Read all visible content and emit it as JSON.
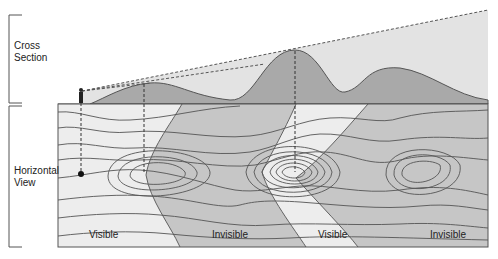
{
  "figure": {
    "sections": {
      "cross_section": {
        "label_line1": "Cross",
        "label_line2": "Section"
      },
      "horizontal_view": {
        "label_line1": "Horizontal",
        "label_line2": "View"
      }
    },
    "regions": [
      {
        "label": "Visible",
        "x": 89
      },
      {
        "label": "Invisible",
        "x": 212
      },
      {
        "label": "Visible",
        "x": 318
      },
      {
        "label": "Invisible",
        "x": 430
      }
    ],
    "colors": {
      "terrain_fill": "#a9a9a9",
      "sightline_wedge": "#e3e3e3",
      "visible_zone": "#ededed",
      "invisible_zone": "#c6c6c6",
      "contour_stroke": "#555555",
      "frame_stroke": "#555555"
    },
    "caption": "Figure 4.2  ..."
  }
}
